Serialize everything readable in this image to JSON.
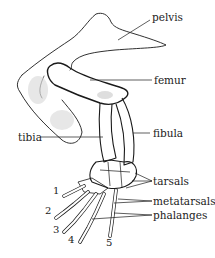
{
  "diagram": {
    "type": "anatomical-illustration",
    "labels": {
      "pelvis": "pelvis",
      "femur": "femur",
      "tibia": "tibia",
      "fibula": "fibula",
      "tarsals": "tarsals",
      "metatarsals": "metatarsals",
      "phalanges": "phalanges"
    },
    "digits": [
      "1",
      "2",
      "3",
      "4",
      "5"
    ],
    "colors": {
      "line": "#1a1a1a",
      "shade": "#c8c8c8",
      "background": "#ffffff"
    }
  }
}
